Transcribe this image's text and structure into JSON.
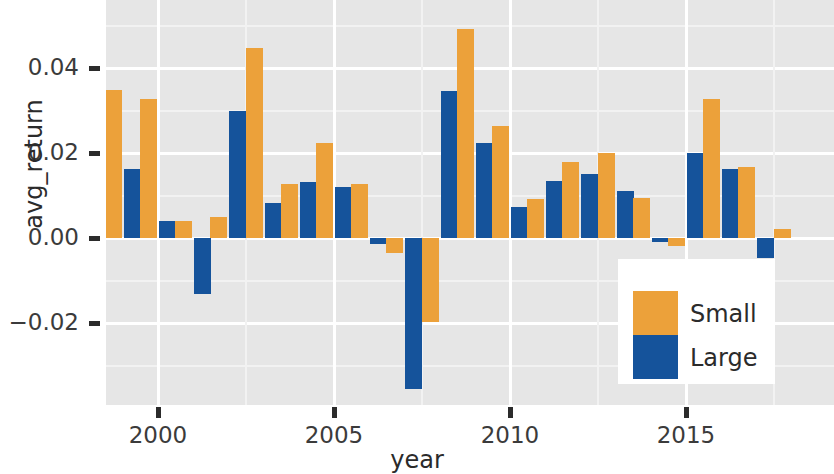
{
  "chart_data": {
    "type": "bar",
    "title": "",
    "xlabel": "year",
    "ylabel": "avg_return",
    "grid": true,
    "legend_position": "inside-bottom-right",
    "xlim": [
      1998.4,
      2018.9
    ],
    "ylim": [
      -0.0395,
      0.056
    ],
    "x_ticks": [
      "2000",
      "2005",
      "2010",
      "2015"
    ],
    "x_tick_values": [
      2000,
      2005,
      2010,
      2015
    ],
    "y_ticks": [
      "0.04",
      "0.02",
      "0.00",
      "−0.02"
    ],
    "y_tick_values": [
      0.04,
      0.02,
      0.0,
      -0.02
    ],
    "categories": [
      1999,
      2000,
      2001,
      2002,
      2003,
      2004,
      2005,
      2006,
      2007,
      2008,
      2009,
      2010,
      2011,
      2012,
      2013,
      2014,
      2015,
      2016,
      2017,
      2018
    ],
    "series": [
      {
        "name": "Small",
        "color": "#eca13a",
        "values": [
          0.0348,
          0.0328,
          0.0041,
          0.0049,
          0.0447,
          0.0127,
          0.0224,
          0.0128,
          -0.0036,
          -0.0198,
          0.0492,
          0.0264,
          0.0092,
          0.0178,
          0.0199,
          0.0095,
          -0.0019,
          0.0327,
          0.0167,
          0.0021
        ]
      },
      {
        "name": "Large",
        "color": "#15539b",
        "values": [
          0.0163,
          0.004,
          -0.0132,
          0.03,
          0.0083,
          0.0132,
          0.0121,
          -0.0015,
          -0.0355,
          0.0345,
          0.0224,
          0.0072,
          0.0134,
          0.015,
          0.0111,
          -0.001,
          0.0201,
          0.0163,
          -0.0048,
          0.0
        ]
      }
    ],
    "annotations": []
  },
  "legend": {
    "items": [
      {
        "label": "Small",
        "color": "#eca13a"
      },
      {
        "label": "Large",
        "color": "#15539b"
      }
    ]
  }
}
